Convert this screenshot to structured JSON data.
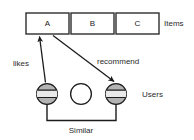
{
  "diagram": {
    "colors": {
      "stroke": "#1c1c1c",
      "box_stroke": "#2e2e2e",
      "box_fill": "#ffffff",
      "user_fill": "#b3b3b3",
      "empty_fill": "#ffffff",
      "text": "#2b2b2b",
      "background": "#ffffff"
    },
    "items": {
      "row_label": "Items",
      "boxes": [
        {
          "label": "A",
          "x": 26,
          "y": 13,
          "w": 43,
          "h": 21
        },
        {
          "label": "B",
          "x": 71,
          "y": 13,
          "w": 43,
          "h": 21
        },
        {
          "label": "C",
          "x": 116,
          "y": 13,
          "w": 43,
          "h": 21
        }
      ]
    },
    "users": {
      "row_label": "Users",
      "nodes": [
        {
          "name": "user-left",
          "shaded": true,
          "cx": 47,
          "cy": 94,
          "r": 11
        },
        {
          "name": "user-middle",
          "shaded": false,
          "cx": 81,
          "cy": 94,
          "r": 11
        },
        {
          "name": "user-right",
          "shaded": true,
          "cx": 116,
          "cy": 94,
          "r": 11
        }
      ]
    },
    "edges": [
      {
        "name": "likes",
        "label": "likes",
        "from": "user-left",
        "to": "item-a",
        "label_x": 14,
        "label_y": 64
      },
      {
        "name": "recommend",
        "label": "recommend",
        "from": "item-a",
        "to": "user-right",
        "label_x": 98,
        "label_y": 62
      }
    ],
    "bracket": {
      "label": "Similar",
      "label_x": 81,
      "label_y": 131
    }
  }
}
